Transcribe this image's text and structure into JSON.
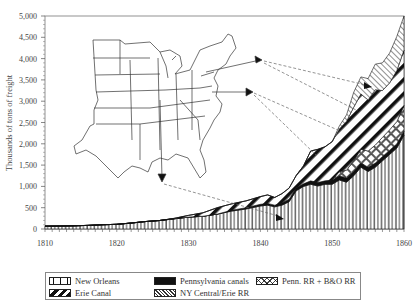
{
  "chart_data": {
    "type": "area",
    "stacked": true,
    "title": "",
    "xlabel": "",
    "ylabel": "Thousands of tons of freight",
    "xlim": [
      1810,
      1860
    ],
    "ylim": [
      0,
      5000
    ],
    "x_ticks": [
      "1810",
      "1820",
      "1830",
      "1840",
      "1850",
      "1860"
    ],
    "y_ticks": [
      "0",
      "500",
      "1,000",
      "1,500",
      "2,000",
      "2,500",
      "3,000",
      "3,500",
      "4,000",
      "4,500",
      "5,000"
    ],
    "grid": false,
    "legend_position": "bottom",
    "x": [
      1810,
      1812,
      1814,
      1816,
      1818,
      1820,
      1822,
      1824,
      1826,
      1828,
      1830,
      1832,
      1834,
      1836,
      1838,
      1840,
      1841,
      1842,
      1843,
      1844,
      1845,
      1846,
      1847,
      1848,
      1849,
      1850,
      1851,
      1852,
      1853,
      1854,
      1855,
      1856,
      1857,
      1858,
      1859,
      1860
    ],
    "series": [
      {
        "name": "New Orleans",
        "pattern": "vertical-bars",
        "values": [
          67,
          70,
          75,
          85,
          100,
          110,
          140,
          175,
          200,
          240,
          280,
          300,
          350,
          420,
          470,
          540,
          560,
          520,
          560,
          640,
          900,
          1000,
          1050,
          1010,
          1050,
          1050,
          1150,
          1100,
          1250,
          1450,
          1350,
          1450,
          1600,
          1750,
          1900,
          2200
        ]
      },
      {
        "name": "Pennsylvania canals",
        "pattern": "solid-black",
        "values": [
          0,
          0,
          0,
          0,
          0,
          0,
          0,
          0,
          0,
          0,
          0,
          0,
          0,
          20,
          30,
          40,
          40,
          40,
          50,
          60,
          60,
          60,
          80,
          80,
          80,
          100,
          100,
          100,
          100,
          100,
          100,
          100,
          100,
          100,
          100,
          100
        ]
      },
      {
        "name": "Penn. RR + B&O RR",
        "pattern": "crosshatch",
        "values": [
          0,
          0,
          0,
          0,
          0,
          0,
          0,
          0,
          0,
          0,
          0,
          0,
          0,
          0,
          0,
          0,
          0,
          0,
          0,
          0,
          0,
          0,
          0,
          0,
          0,
          0,
          100,
          180,
          260,
          320,
          380,
          420,
          450,
          480,
          520,
          600
        ]
      },
      {
        "name": "Erie Canal",
        "pattern": "diagonal-thick",
        "values": [
          0,
          0,
          0,
          0,
          0,
          0,
          0,
          0,
          0,
          10,
          40,
          80,
          150,
          150,
          160,
          180,
          200,
          180,
          220,
          260,
          300,
          420,
          700,
          780,
          800,
          900,
          1000,
          1150,
          1250,
          1300,
          1200,
          1300,
          1100,
          1100,
          1200,
          1300
        ]
      },
      {
        "name": "NY Central/Erie RR",
        "pattern": "diagonal-thin",
        "values": [
          0,
          0,
          0,
          0,
          0,
          0,
          0,
          0,
          0,
          0,
          0,
          0,
          0,
          0,
          0,
          0,
          0,
          0,
          0,
          0,
          0,
          0,
          0,
          0,
          0,
          0,
          70,
          150,
          350,
          400,
          500,
          600,
          650,
          700,
          800,
          800
        ]
      }
    ],
    "annotations": [
      "Inset outline map of the eastern United States with arrows from New Orleans, Philadelphia/Pennsylvania and New York pointing to their respective freight bands"
    ]
  },
  "legend": {
    "items": [
      {
        "label": "New Orleans"
      },
      {
        "label": "Erie Canal"
      },
      {
        "label": "Pennsylvania canals"
      },
      {
        "label": "NY Central/Erie RR"
      },
      {
        "label": "Penn. RR + B&O RR"
      }
    ]
  }
}
